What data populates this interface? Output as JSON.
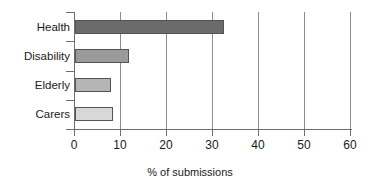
{
  "chart_data": {
    "type": "bar",
    "orientation": "horizontal",
    "title": "",
    "xlabel": "% of submissions",
    "ylabel": "",
    "categories": [
      "Health",
      "Disability",
      "Elderly",
      "Carers"
    ],
    "values": [
      32.3,
      11.7,
      7.8,
      8.3
    ],
    "xlim": [
      0,
      60
    ],
    "xticks": [
      0,
      10,
      20,
      30,
      40,
      50,
      60
    ],
    "xtick_labels": [
      "0",
      "10",
      "20",
      "30",
      "40",
      "50",
      "60"
    ],
    "grid": "vertical",
    "legend": "none",
    "bar_colors": [
      "#6b6b6b",
      "#9a9a9a",
      "#b5b5b5",
      "#d8d8d8"
    ],
    "bar_edge_color": "#545454",
    "axis_color": "#6e6e6e",
    "gridline_color": "#8c8c8c",
    "background": "#ffffff"
  }
}
